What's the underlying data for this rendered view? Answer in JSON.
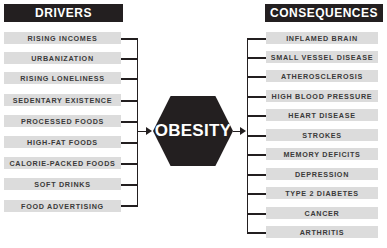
{
  "diagram": {
    "center": {
      "label": "OBESITY"
    },
    "drivers": {
      "title": "DRIVERS",
      "items": [
        "RISING INCOMES",
        "URBANIZATION",
        "RISING LONELINESS",
        "SEDENTARY EXISTENCE",
        "PROCESSED FOODS",
        "HIGH-FAT FOODS",
        "CALORIE-PACKED FOODS",
        "SOFT DRINKS",
        "FOOD ADVERTISING"
      ]
    },
    "consequences": {
      "title": "CONSEQUENCES",
      "items": [
        "INFLAMED BRAIN",
        "SMALL VESSEL DISEASE",
        "ATHEROSCLEROSIS",
        "HIGH BLOOD PRESSURE",
        "HEART DISEASE",
        "STROKES",
        "MEMORY DEFICITS",
        "DEPRESSION",
        "TYPE 2 DIABETES",
        "CANCER",
        "ARTHRITIS"
      ]
    },
    "colors": {
      "dark": "#231f20",
      "box": "#dcdcdc",
      "text": "#3a3a3a"
    }
  }
}
